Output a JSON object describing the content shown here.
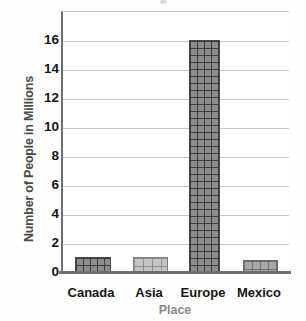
{
  "chart_data": {
    "type": "bar",
    "title": "",
    "xlabel": "Place",
    "ylabel": "Number of People in Millions",
    "categories": [
      "Canada",
      "Asia",
      "Europe",
      "Mexico"
    ],
    "values": [
      1,
      1,
      16,
      0.8
    ],
    "ylim": [
      0,
      17
    ],
    "yticks": [
      0,
      2,
      4,
      6,
      8,
      10,
      12,
      14,
      16
    ],
    "ytick_labels": [
      "0",
      "2",
      "4",
      "6",
      "8",
      "10",
      "12",
      "14",
      "16"
    ],
    "grid": true,
    "legend": false,
    "series": [
      {
        "name": "Number of People in Millions",
        "values": [
          1,
          1,
          16,
          0.8
        ]
      }
    ],
    "bar_styles": [
      "dark",
      "light",
      "dark",
      "mid"
    ],
    "colors": {
      "bar_dark": "#8c8c8c",
      "bar_mid": "#a6a6a6",
      "bar_light": "#c4c4c4",
      "gridline": "#c9c9c9",
      "axis": "#6f6f6f",
      "tick_text": "#151515",
      "ylabel_text": "#4b4b4b",
      "xlabel_text": "#8a8a8a",
      "plot_background": "#ffffff"
    }
  },
  "axes": {
    "y_title": "Number of People in Millions",
    "x_title": "Place",
    "y_tick_0": "0",
    "y_tick_1": "2",
    "y_tick_2": "4",
    "y_tick_3": "6",
    "y_tick_4": "8",
    "y_tick_5": "10",
    "y_tick_6": "12",
    "y_tick_7": "14",
    "y_tick_8": "16",
    "x_cat_0": "Canada",
    "x_cat_1": "Asia",
    "x_cat_2": "Europe",
    "x_cat_3": "Mexico"
  }
}
